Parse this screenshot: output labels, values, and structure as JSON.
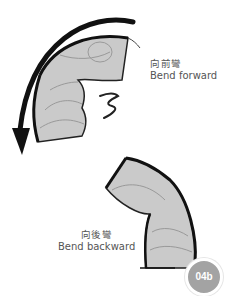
{
  "figure": {
    "forward": {
      "label_zh": "向前彎",
      "label_en": "Bend forward"
    },
    "backward": {
      "label_zh": "向後彎",
      "label_en": "Bend backward"
    },
    "badge": "04b"
  },
  "colors": {
    "fill": "#c9c9c9",
    "stroke": "#1a1a1a",
    "text": "#555555",
    "badge_bg": "#a3a3a3"
  }
}
